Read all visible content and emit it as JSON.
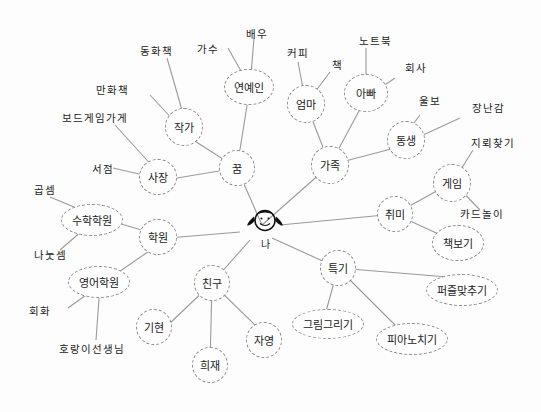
{
  "center": {
    "label": "나",
    "icon": "smiley-girl-icon"
  },
  "branches": {
    "dream": {
      "label": "꿈"
    },
    "family": {
      "label": "가족"
    },
    "hobby": {
      "label": "취미"
    },
    "talent": {
      "label": "특기"
    },
    "friends": {
      "label": "친구"
    },
    "academy": {
      "label": "학원"
    }
  },
  "nodes": {
    "entertainer": "연예인",
    "writer": "작가",
    "boss": "사장",
    "mom": "엄마",
    "dad": "아빠",
    "sibling": "동생",
    "game": "게임",
    "read": "책보기",
    "puzzle": "퍼즐맞추기",
    "drawing": "그림그리기",
    "piano": "피아노치기",
    "giheon": "기현",
    "huijae": "희재",
    "jayeong": "자영",
    "math_academy": "수학학원",
    "english_academy": "영어학원"
  },
  "leaves": {
    "singer": "가수",
    "actor": "배우",
    "fairy_tale": "동화책",
    "comic": "만화책",
    "boardgame_shop": "보드게임가게",
    "bookstore": "서점",
    "coffee": "커피",
    "book": "책",
    "notebook": "노트북",
    "company": "회사",
    "crybaby": "울보",
    "prankster": "장난감",
    "hidden_picture": "지뢰찾기",
    "card_game": "카드놀이",
    "multiplication": "곱셈",
    "division": "나눗셈",
    "conversation": "회화",
    "tiger_teacher": "호랑이선생님"
  }
}
